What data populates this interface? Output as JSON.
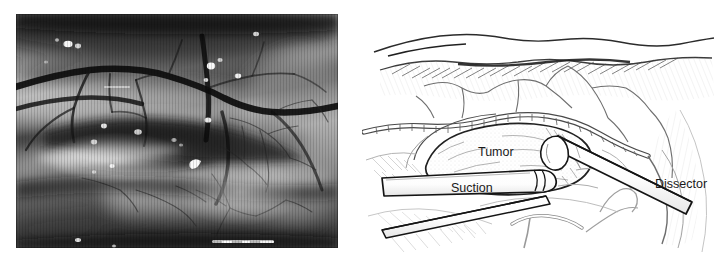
{
  "figure": {
    "panels": [
      {
        "id": "intraoperative-photograph",
        "kind": "photograph",
        "description": "Intraoperative microscope photograph of the brain surface showing cortical vessels, a sulcus and specular highlights from irrigation fluid",
        "labels": []
      },
      {
        "id": "surgical-line-drawing",
        "kind": "line-drawing",
        "description": "Pen and ink artist rendering of the same operative field during tumor resection",
        "labels": [
          {
            "name": "tumor",
            "text": "Tumor",
            "x": 478,
            "y": 152
          },
          {
            "name": "suction",
            "text": "Suction",
            "x": 451,
            "y": 192
          },
          {
            "name": "dissector",
            "text": "Dissector",
            "x": 655,
            "y": 188
          }
        ]
      }
    ],
    "colors": {
      "background": "#ffffff",
      "ink": "#1a1a1a",
      "ink_light": "#8d8d8d",
      "ink_faint": "#c3c3c3",
      "photo_dark": "#1c1c1c",
      "photo_mid": "#7d7d7d",
      "photo_light": "#dedede"
    }
  }
}
